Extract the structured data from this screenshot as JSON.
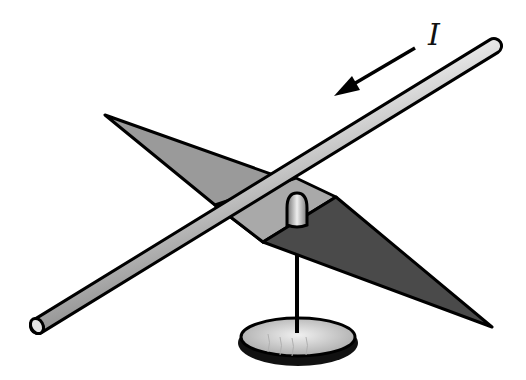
{
  "figure": {
    "current_label": "I",
    "colors": {
      "background": "#ffffff",
      "outline": "#000000",
      "needle_light": "#9a9a9a",
      "needle_face": "#a8a8a8",
      "needle_dark": "#4a4a4a",
      "rod_highlight": "#f2f2f2",
      "rod_shade": "#8c8c8c",
      "base_fill": "#d4d4d4"
    }
  }
}
